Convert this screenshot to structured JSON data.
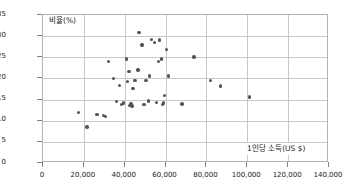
{
  "chart_data": {
    "type": "scatter",
    "title": "",
    "xlabel": "1인당 소득(US $)",
    "ylabel": "비율(%)",
    "xlim": [
      0,
      140000
    ],
    "ylim": [
      0,
      35
    ],
    "xticks": [
      0,
      20000,
      40000,
      60000,
      80000,
      100000,
      120000,
      140000
    ],
    "xtick_labels": [
      "0",
      "20,000",
      "40,000",
      "60,000",
      "80,000",
      "100,000",
      "120,000",
      "140,000"
    ],
    "yticks": [
      0,
      5,
      10,
      15,
      20,
      25,
      30,
      35
    ],
    "ytick_labels": [
      "0",
      "5",
      "10",
      "15",
      "20",
      "25",
      "30",
      "35"
    ],
    "grid": true,
    "legend": "none",
    "point_color": "#555555",
    "gridline_color": "#c8c8c8",
    "frame_color": "#b4b4b4",
    "points": [
      [
        17500,
        12.0
      ],
      [
        21500,
        8.5
      ],
      [
        26500,
        11.5
      ],
      [
        29500,
        11.3
      ],
      [
        30500,
        11.0
      ],
      [
        32000,
        24.0
      ],
      [
        34500,
        20.0
      ],
      [
        36000,
        14.5
      ],
      [
        37500,
        18.3
      ],
      [
        38500,
        13.8
      ],
      [
        39500,
        14.2
      ],
      [
        41000,
        24.6
      ],
      [
        41500,
        19.3
      ],
      [
        42000,
        21.7
      ],
      [
        42500,
        13.6
      ],
      [
        43000,
        14.0
      ],
      [
        43500,
        13.5
      ],
      [
        44000,
        17.6
      ],
      [
        45000,
        19.5
      ],
      [
        46500,
        22.0
      ],
      [
        47000,
        30.8
      ],
      [
        48500,
        27.9
      ],
      [
        49500,
        13.9
      ],
      [
        50500,
        19.5
      ],
      [
        51500,
        14.7
      ],
      [
        52000,
        20.6
      ],
      [
        53000,
        29.2
      ],
      [
        54500,
        28.5
      ],
      [
        55500,
        14.3
      ],
      [
        56500,
        24.0
      ],
      [
        57000,
        29.1
      ],
      [
        58000,
        24.6
      ],
      [
        58500,
        13.9
      ],
      [
        59000,
        14.2
      ],
      [
        59500,
        15.9
      ],
      [
        60500,
        26.9
      ],
      [
        61500,
        20.6
      ],
      [
        68000,
        14.0
      ],
      [
        74000,
        25.1
      ],
      [
        82000,
        19.5
      ],
      [
        87000,
        18.2
      ],
      [
        101000,
        15.6
      ]
    ]
  }
}
